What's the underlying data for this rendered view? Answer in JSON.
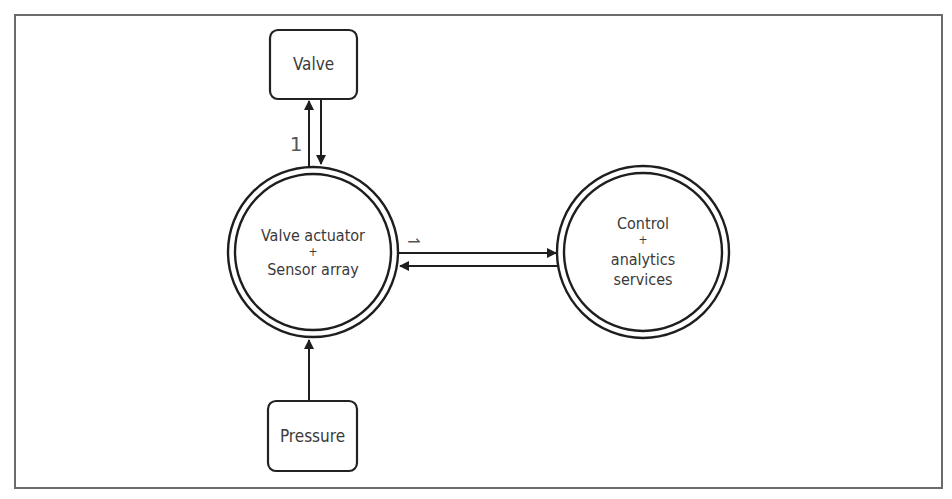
{
  "diagram": {
    "type": "block-diagram",
    "nodes": {
      "valve": {
        "label": "Valve",
        "shape": "rounded-rect"
      },
      "actuator": {
        "line1": "Valve actuator",
        "plus": "+",
        "line2": "Sensor array",
        "shape": "double-circle"
      },
      "control": {
        "line1": "Control",
        "plus": "+",
        "line2": "analytics",
        "line3": "services",
        "shape": "double-circle"
      },
      "pressure": {
        "label": "Pressure",
        "shape": "rounded-rect"
      }
    },
    "edges": [
      {
        "from": "actuator",
        "to": "valve",
        "label": "1"
      },
      {
        "from": "valve",
        "to": "actuator",
        "label": ""
      },
      {
        "from": "actuator",
        "to": "control",
        "label": "⇀"
      },
      {
        "from": "control",
        "to": "actuator",
        "label": ""
      },
      {
        "from": "pressure",
        "to": "actuator",
        "label": ""
      }
    ],
    "edge_labels": {
      "valve_link": "1",
      "control_link": "⇀"
    },
    "colors": {
      "stroke": "#1e1e1e",
      "frame": "#6b6b6b",
      "text": "#3a3a3a",
      "background": "#ffffff"
    }
  }
}
